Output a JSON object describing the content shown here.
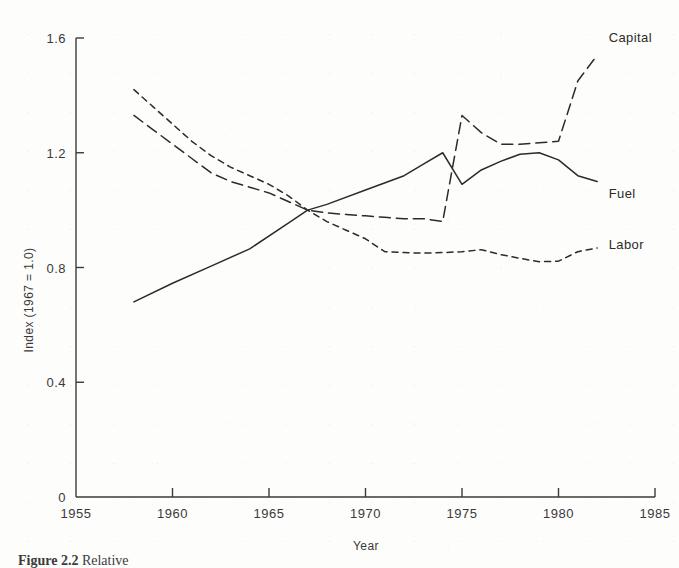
{
  "figure": {
    "caption_number": "Figure 2.2",
    "caption_text": "Relative"
  },
  "chart_data": {
    "type": "line",
    "title": "",
    "xlabel": "Year",
    "ylabel": "Index (1967 = 1.0)",
    "xlim": [
      1955,
      1985
    ],
    "ylim": [
      0,
      1.6
    ],
    "grid": false,
    "legend_position": "right-inline",
    "xticks": [
      1955,
      1960,
      1965,
      1970,
      1975,
      1980,
      1985
    ],
    "xtick_labels": [
      "1955",
      "1960",
      "1965",
      "1970",
      "1975",
      "1980",
      "1985"
    ],
    "yticks": [
      0,
      0.4,
      0.8,
      1.2,
      1.6
    ],
    "ytick_labels": [
      "0",
      "0.4",
      "0.8",
      "1.2",
      "1.6"
    ],
    "series": [
      {
        "name": "Capital",
        "label": "Capital",
        "style": "long-dash",
        "color": "#2b2b2b",
        "x": [
          1958,
          1959,
          1960,
          1961,
          1962,
          1963,
          1964,
          1965,
          1966,
          1967,
          1968,
          1969,
          1970,
          1971,
          1972,
          1973,
          1974,
          1975,
          1976,
          1977,
          1978,
          1979,
          1980,
          1981,
          1982
        ],
        "y": [
          1.33,
          1.28,
          1.23,
          1.18,
          1.13,
          1.1,
          1.08,
          1.06,
          1.03,
          1.0,
          0.99,
          0.985,
          0.98,
          0.975,
          0.97,
          0.97,
          0.96,
          1.33,
          1.27,
          1.23,
          1.23,
          1.235,
          1.24,
          1.45,
          1.54
        ]
      },
      {
        "name": "Fuel",
        "label": "Fuel",
        "style": "solid",
        "color": "#2b2b2b",
        "x": [
          1958,
          1960,
          1962,
          1964,
          1966,
          1967,
          1968,
          1970,
          1972,
          1973,
          1974,
          1975,
          1976,
          1977,
          1978,
          1979,
          1980,
          1981,
          1982
        ],
        "y": [
          0.68,
          0.745,
          0.805,
          0.865,
          0.955,
          1.0,
          1.02,
          1.07,
          1.12,
          1.16,
          1.2,
          1.09,
          1.14,
          1.17,
          1.195,
          1.2,
          1.175,
          1.12,
          1.1
        ]
      },
      {
        "name": "Labor",
        "label": "Labor",
        "style": "short-dash",
        "color": "#2b2b2b",
        "x": [
          1958,
          1959,
          1960,
          1961,
          1962,
          1963,
          1964,
          1965,
          1966,
          1967,
          1968,
          1969,
          1970,
          1971,
          1972,
          1973,
          1974,
          1975,
          1976,
          1977,
          1978,
          1979,
          1980,
          1981,
          1982
        ],
        "y": [
          1.42,
          1.36,
          1.3,
          1.24,
          1.19,
          1.15,
          1.12,
          1.09,
          1.05,
          1.0,
          0.96,
          0.93,
          0.9,
          0.855,
          0.852,
          0.85,
          0.852,
          0.855,
          0.862,
          0.845,
          0.832,
          0.82,
          0.822,
          0.855,
          0.868
        ]
      }
    ],
    "annotations": [
      {
        "text": "Capital",
        "x": 1982.6,
        "y": 1.6
      },
      {
        "text": "Fuel",
        "x": 1982.6,
        "y": 1.055
      },
      {
        "text": "Labor",
        "x": 1982.6,
        "y": 0.878
      }
    ]
  }
}
